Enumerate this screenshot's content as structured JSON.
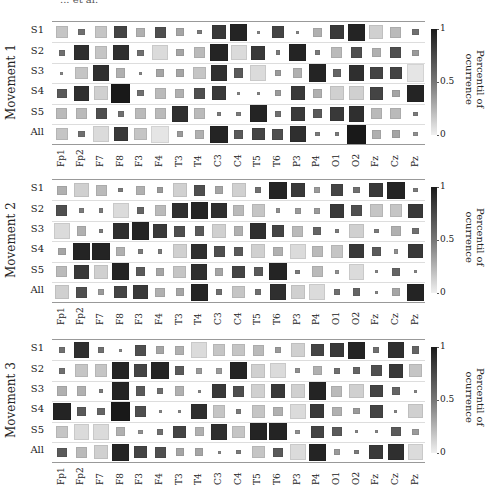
{
  "header": {
    "clipped_text": "... et al."
  },
  "chart_data": {
    "type": "heatmap",
    "encoding": "square size and grayscale darkness encode percentile of occurrence (dark = 1, light = 0)",
    "xlabel": "",
    "colorbar": {
      "label_line1": "Percentil of",
      "label_line2": "ocurrence",
      "ticks": [
        "1",
        "0.5",
        "0"
      ],
      "range": [
        0,
        1
      ]
    },
    "channels": [
      "Fp1",
      "Fp2",
      "F7",
      "F8",
      "F3",
      "F4",
      "T3",
      "T4",
      "C3",
      "C4",
      "T5",
      "T6",
      "P3",
      "P4",
      "O1",
      "O2",
      "Fz",
      "Cz",
      "Pz"
    ],
    "rows": [
      "S1",
      "S2",
      "S3",
      "S4",
      "S5",
      "All"
    ],
    "panels": [
      {
        "title": "Movement 1",
        "values": [
          [
            0.2,
            0.6,
            0.2,
            0.8,
            0.3,
            0.75,
            0.35,
            0.55,
            0.85,
            0.95,
            0.5,
            0.8,
            0.5,
            0.3,
            0.85,
            0.95,
            0.15,
            0.25,
            0.6
          ],
          [
            0.6,
            0.9,
            0.2,
            0.9,
            0.6,
            0.1,
            0.35,
            0.25,
            0.95,
            0.1,
            0.85,
            0.55,
            0.95,
            0.55,
            0.25,
            0.75,
            0.3,
            0.75,
            0.4
          ],
          [
            0.5,
            0.2,
            0.9,
            0.3,
            0.5,
            0.35,
            0.35,
            0.2,
            0.9,
            0.7,
            0.1,
            0.4,
            0.3,
            0.95,
            0.65,
            0.9,
            0.8,
            0.8,
            0.05
          ],
          [
            0.7,
            0.9,
            0.15,
            1.0,
            0.6,
            0.25,
            0.3,
            0.75,
            0.85,
            0.5,
            0.5,
            0.4,
            0.85,
            0.3,
            0.15,
            0.15,
            0.8,
            0.35,
            0.95
          ],
          [
            0.25,
            0.25,
            0.75,
            0.6,
            0.25,
            0.25,
            0.9,
            0.25,
            0.55,
            0.55,
            0.95,
            0.6,
            0.85,
            0.7,
            0.85,
            0.9,
            0.25,
            0.25,
            0.55
          ],
          [
            0.2,
            0.6,
            0.1,
            0.85,
            0.2,
            0.05,
            0.4,
            0.3,
            0.95,
            0.7,
            0.8,
            0.75,
            0.9,
            0.55,
            0.55,
            1.0,
            0.3,
            0.35,
            0.45
          ]
        ]
      },
      {
        "title": "Movement 2",
        "values": [
          [
            0.3,
            0.15,
            0.25,
            0.55,
            0.3,
            0.4,
            0.15,
            0.75,
            0.35,
            0.15,
            0.6,
            0.95,
            0.85,
            0.4,
            0.8,
            0.6,
            0.85,
            0.95,
            0.55
          ],
          [
            0.75,
            0.55,
            0.55,
            0.1,
            0.65,
            0.25,
            0.9,
            0.95,
            0.9,
            0.25,
            0.2,
            0.45,
            0.4,
            0.4,
            0.85,
            0.75,
            0.2,
            0.2,
            0.85
          ],
          [
            0.1,
            0.3,
            0.55,
            0.9,
            0.95,
            0.85,
            0.75,
            0.7,
            0.15,
            0.3,
            0.9,
            0.8,
            0.25,
            0.65,
            0.55,
            0.15,
            0.55,
            0.3,
            0.6
          ],
          [
            0.35,
            0.95,
            0.95,
            0.3,
            0.55,
            0.55,
            0.15,
            0.9,
            0.75,
            0.7,
            0.15,
            0.3,
            0.1,
            0.25,
            0.2,
            0.85,
            0.7,
            0.45,
            0.85
          ],
          [
            0.25,
            0.85,
            0.15,
            0.95,
            0.7,
            0.35,
            0.2,
            0.9,
            0.35,
            0.8,
            0.7,
            0.95,
            0.55,
            0.25,
            0.45,
            0.1,
            0.5,
            0.65,
            0.5
          ],
          [
            0.15,
            0.75,
            0.4,
            0.8,
            0.85,
            0.3,
            0.35,
            0.95,
            0.6,
            0.2,
            0.6,
            0.9,
            0.15,
            0.1,
            0.6,
            0.65,
            0.5,
            0.35,
            0.95
          ]
        ]
      },
      {
        "title": "Movement 3",
        "values": [
          [
            0.6,
            0.9,
            0.6,
            0.5,
            0.75,
            0.35,
            0.3,
            0.1,
            0.2,
            0.2,
            0.25,
            0.4,
            0.15,
            0.8,
            0.85,
            0.95,
            0.6,
            0.9,
            0.65
          ],
          [
            0.6,
            0.2,
            0.2,
            0.95,
            0.8,
            0.95,
            0.7,
            0.4,
            0.4,
            0.95,
            0.15,
            0.1,
            0.45,
            0.3,
            0.6,
            0.65,
            0.75,
            0.85,
            0.2
          ],
          [
            0.3,
            0.3,
            0.55,
            0.95,
            0.7,
            0.6,
            0.3,
            0.5,
            0.85,
            0.75,
            0.15,
            0.85,
            0.15,
            0.95,
            0.25,
            0.15,
            0.8,
            0.65,
            0.5
          ],
          [
            0.95,
            0.7,
            0.65,
            1.0,
            0.75,
            0.5,
            0.5,
            0.9,
            0.2,
            0.55,
            0.2,
            0.3,
            0.1,
            0.85,
            0.3,
            0.4,
            0.8,
            0.5,
            0.15
          ],
          [
            0.2,
            0.1,
            0.1,
            0.3,
            0.45,
            0.6,
            0.8,
            0.3,
            0.9,
            0.2,
            0.95,
            0.95,
            0.45,
            0.8,
            0.7,
            0.5,
            0.5,
            0.7,
            0.4
          ],
          [
            0.7,
            0.25,
            0.15,
            0.95,
            0.8,
            0.75,
            0.35,
            0.35,
            0.5,
            0.55,
            0.2,
            0.7,
            0.1,
            0.95,
            0.4,
            0.55,
            0.85,
            0.9,
            0.1
          ]
        ]
      }
    ]
  }
}
